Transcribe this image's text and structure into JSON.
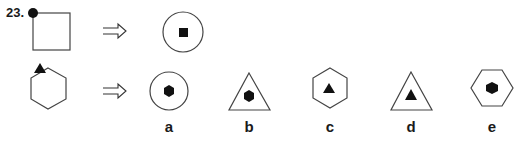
{
  "question": {
    "number": "23.",
    "example": {
      "given": {
        "shape": "square",
        "marker": "black-circle",
        "marker_position": "top-left-vertex"
      },
      "result": {
        "outer": "circle",
        "inner": "black-square"
      }
    },
    "problem": {
      "given": {
        "shape": "hexagon",
        "marker": "black-triangle",
        "marker_position": "top-left-vertex"
      }
    },
    "arrow_icon": "double-arrow-right",
    "options": [
      {
        "label": "a",
        "outer": "circle",
        "inner": "black-hexagon"
      },
      {
        "label": "b",
        "outer": "triangle",
        "inner": "black-hexagon"
      },
      {
        "label": "c",
        "outer": "hexagon",
        "inner": "black-triangle"
      },
      {
        "label": "d",
        "outer": "triangle",
        "inner": "black-triangle"
      },
      {
        "label": "e",
        "outer": "hexagon-flat",
        "inner": "black-hexagon"
      }
    ]
  },
  "colors": {
    "stroke": "#333333",
    "fill": "#111111",
    "background": "#ffffff"
  }
}
